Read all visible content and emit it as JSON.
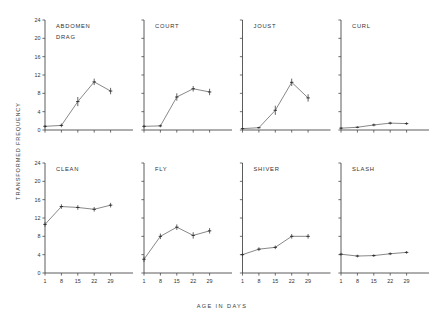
{
  "figure": {
    "ylabel": "TRANSFORMED   FREQUENCY",
    "xlabel": "AGE   IN   DAYS"
  },
  "chart_data": {
    "type": "line",
    "title": "",
    "xlabel": "AGE IN DAYS",
    "ylabel": "TRANSFORMED FREQUENCY",
    "x": [
      1,
      8,
      15,
      22,
      29
    ],
    "xtick_labels": [
      "1",
      "8",
      "15",
      "22",
      "29"
    ],
    "ytick_labels": [
      "0",
      "4",
      "8",
      "12",
      "16",
      "20",
      "24"
    ],
    "yticks": [
      0,
      4,
      8,
      12,
      16,
      20,
      24
    ],
    "ylim": [
      0,
      24
    ],
    "xlim": [
      0,
      32
    ],
    "grid": false,
    "legend": "none",
    "error_bars": "standard error",
    "layout": "2 rows x 4 columns of small-multiple panels",
    "panels": [
      {
        "label": "ABDOMEN DRAG",
        "label_lines": [
          "ABDOMEN",
          "DRAG"
        ],
        "row": 0,
        "col": 0,
        "values": [
          0.8,
          1.0,
          6.2,
          10.5,
          8.5
        ],
        "errors": [
          0.3,
          0.4,
          1.0,
          0.7,
          0.7
        ]
      },
      {
        "label": "COURT",
        "label_lines": [
          "COURT"
        ],
        "row": 0,
        "col": 1,
        "values": [
          0.8,
          0.9,
          7.2,
          9.0,
          8.3
        ],
        "errors": [
          0.3,
          0.3,
          0.8,
          0.6,
          0.7
        ]
      },
      {
        "label": "JOUST",
        "label_lines": [
          "JOUST"
        ],
        "row": 0,
        "col": 2,
        "values": [
          0.3,
          0.5,
          4.3,
          10.4,
          7.0
        ],
        "errors": [
          0.2,
          0.2,
          1.0,
          0.8,
          0.8
        ]
      },
      {
        "label": "CURL",
        "label_lines": [
          "CURL"
        ],
        "row": 0,
        "col": 3,
        "values": [
          0.4,
          0.6,
          1.1,
          1.5,
          1.4
        ],
        "errors": [
          0.2,
          0.2,
          0.3,
          0.3,
          0.3
        ]
      },
      {
        "label": "CLEAN",
        "label_lines": [
          "CLEAN"
        ],
        "row": 1,
        "col": 0,
        "values": [
          10.6,
          14.5,
          14.3,
          13.9,
          14.8
        ],
        "errors": [
          0.5,
          0.5,
          0.5,
          0.5,
          0.5
        ]
      },
      {
        "label": "FLY",
        "label_lines": [
          "FLY"
        ],
        "row": 1,
        "col": 1,
        "values": [
          3.0,
          8.0,
          10.0,
          8.2,
          9.2
        ],
        "errors": [
          0.6,
          0.6,
          0.6,
          0.7,
          0.6
        ]
      },
      {
        "label": "SHIVER",
        "label_lines": [
          "SHIVER"
        ],
        "row": 1,
        "col": 2,
        "values": [
          4.0,
          5.2,
          5.6,
          8.0,
          8.0
        ],
        "errors": [
          0.4,
          0.4,
          0.4,
          0.5,
          0.5
        ]
      },
      {
        "label": "SLASH",
        "label_lines": [
          "SLASH"
        ],
        "row": 1,
        "col": 3,
        "values": [
          4.1,
          3.7,
          3.8,
          4.2,
          4.5
        ],
        "errors": [
          0.3,
          0.3,
          0.3,
          0.3,
          0.3
        ]
      }
    ]
  }
}
